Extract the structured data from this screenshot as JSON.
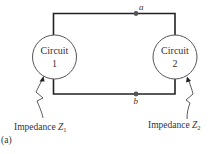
{
  "figure": {
    "panel_label": "(a)",
    "circuits": [
      {
        "id": "circuit1",
        "line1": "Circuit",
        "line2": "1"
      },
      {
        "id": "circuit2",
        "line1": "Circuit",
        "line2": "2"
      }
    ],
    "nodes": [
      {
        "id": "a",
        "label": "a"
      },
      {
        "id": "b",
        "label": "b"
      }
    ],
    "impedance_labels": [
      {
        "prefix": "Impedance ",
        "symbol": "Z",
        "subscript": "1"
      },
      {
        "prefix": "Impedance ",
        "symbol": "Z",
        "subscript": "2"
      }
    ]
  },
  "colors": {
    "wire": "#222222",
    "circle_outline": "#555555",
    "text": "#333333",
    "background": "#ffffff"
  }
}
